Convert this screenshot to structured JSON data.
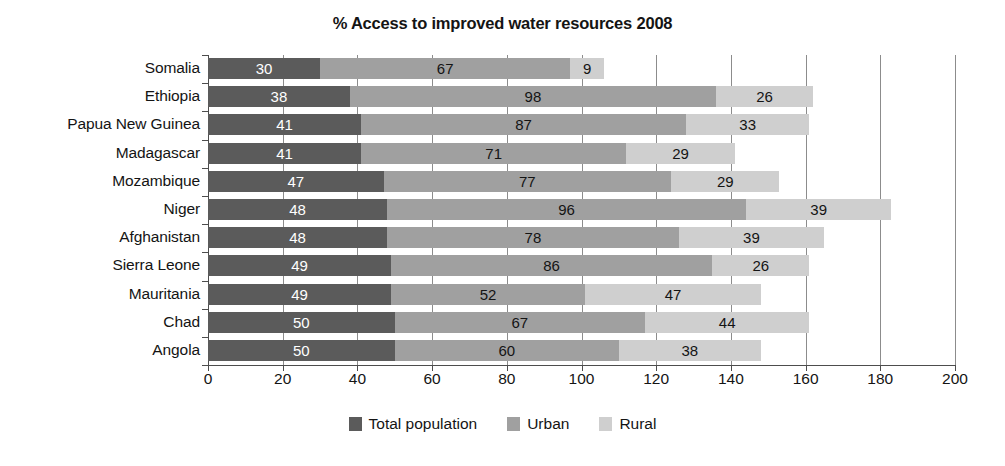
{
  "chart_data": {
    "type": "bar",
    "subtype": "stacked-horizontal-bar",
    "title": "% Access to improved water resources 2008",
    "xlabel": "",
    "ylabel": "",
    "xlim": [
      0,
      200
    ],
    "xticks": [
      0,
      20,
      40,
      60,
      80,
      100,
      120,
      140,
      160,
      180,
      200
    ],
    "grid": true,
    "grid_axis": "x",
    "legend_position": "bottom-center",
    "categories": [
      "Somalia",
      "Ethiopia",
      "Papua New Guinea",
      "Madagascar",
      "Mozambique",
      "Niger",
      "Afghanistan",
      "Sierra Leone",
      "Mauritania",
      "Chad",
      "Angola"
    ],
    "series": [
      {
        "name": "Total population",
        "color": "#5b5b5b",
        "label_color": "#ffffff",
        "values": [
          30,
          38,
          41,
          41,
          47,
          48,
          48,
          49,
          49,
          50,
          50
        ]
      },
      {
        "name": "Urban",
        "color": "#a0a0a0",
        "label_color": "#141414",
        "values": [
          67,
          98,
          87,
          71,
          77,
          96,
          78,
          86,
          52,
          67,
          60
        ]
      },
      {
        "name": "Rural",
        "color": "#cfcfcf",
        "label_color": "#141414",
        "values": [
          9,
          26,
          33,
          29,
          29,
          39,
          39,
          26,
          47,
          44,
          38
        ]
      }
    ],
    "totals": [
      106,
      162,
      161,
      141,
      153,
      183,
      165,
      161,
      148,
      161,
      148
    ]
  },
  "legend": {
    "items": [
      {
        "label": "Total population",
        "color": "#5b5b5b"
      },
      {
        "label": "Urban",
        "color": "#a0a0a0"
      },
      {
        "label": "Rural",
        "color": "#cfcfcf"
      }
    ]
  }
}
